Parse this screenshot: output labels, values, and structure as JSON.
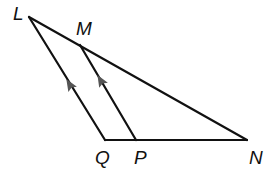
{
  "diagram": {
    "type": "geometry-triangle",
    "colors": {
      "line": "#111111",
      "arrow": "#555555",
      "background": "#ffffff"
    },
    "points": {
      "L": {
        "label": "L",
        "x": 29,
        "y": 17
      },
      "M": {
        "label": "M",
        "x": 80,
        "y": 45
      },
      "Q": {
        "label": "Q",
        "x": 105,
        "y": 140
      },
      "P": {
        "label": "P",
        "x": 136,
        "y": 140
      },
      "N": {
        "label": "N",
        "x": 247,
        "y": 140
      }
    },
    "segments": [
      {
        "from": "L",
        "to": "N"
      },
      {
        "from": "L",
        "to": "Q"
      },
      {
        "from": "Q",
        "to": "N"
      },
      {
        "from": "M",
        "to": "P"
      }
    ],
    "parallel_marks": [
      {
        "segment": "LQ",
        "direction": "toward L"
      },
      {
        "segment": "MP",
        "direction": "toward M"
      }
    ],
    "relation": "LQ ∥ MP"
  }
}
